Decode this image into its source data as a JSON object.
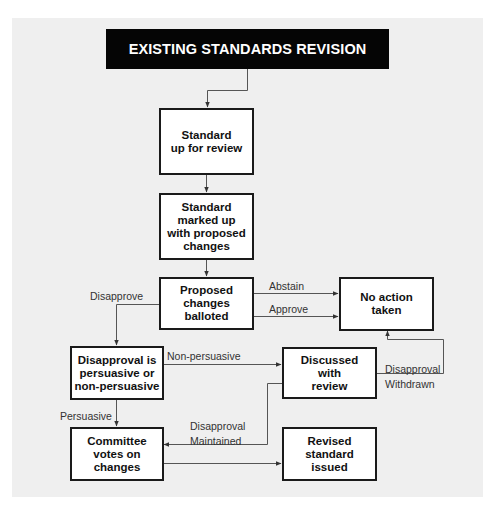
{
  "diagram": {
    "title": "EXISTING STANDARDS REVISION",
    "nodes": {
      "review": "Standard\nup for review",
      "marked": "Standard\nmarked up\nwith proposed\nchanges",
      "balloted": "Proposed\nchanges\nballoted",
      "no_action": "No action\ntaken",
      "persuasive_q": "Disapproval is\npersuasive or\nnon-persuasive",
      "discussed": "Discussed\nwith\nreview",
      "committee": "Committee\nvotes on\nchanges",
      "revised": "Revised\nstandard\nissued"
    },
    "edge_labels": {
      "abstain": "Abstain",
      "approve": "Approve",
      "disapprove": "Disapprove",
      "non_persuasive": "Non-persuasive",
      "persuasive": "Persuasive",
      "withdrawn": "Disapproval\nWithdrawn",
      "maintained": "Disapproval\nMaintained"
    },
    "colors": {
      "panel": "#efefef",
      "title_bg": "#050505",
      "title_fg": "#ffffff",
      "box_border": "#1a1a1a",
      "wire": "#555555"
    }
  }
}
